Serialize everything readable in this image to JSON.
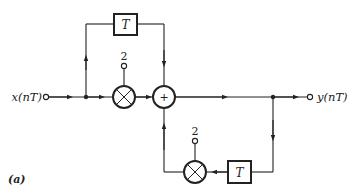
{
  "diagram": {
    "type": "signal-flow block diagram",
    "input_label": "x(nT)",
    "output_label": "y(nT)",
    "figure_label": "(a)",
    "delay_top_label": "T",
    "delay_bottom_label": "T",
    "multiplier_top_coefficient": "2",
    "multiplier_bottom_coefficient": "2",
    "adder_symbol": "+",
    "colors": {
      "stroke": "#222222",
      "background": "#ffffff"
    }
  }
}
